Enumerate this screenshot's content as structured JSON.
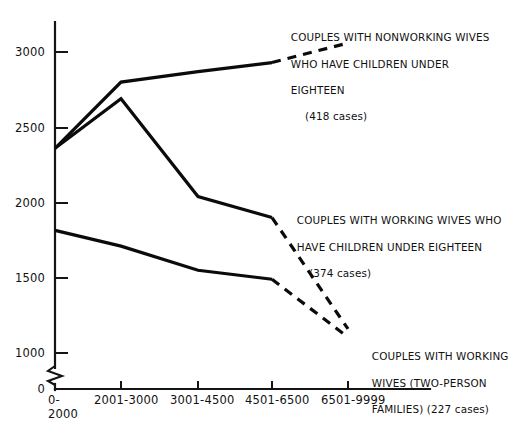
{
  "chart_data": {
    "type": "line",
    "title": "",
    "xlabel": "",
    "ylabel": "",
    "categories": [
      "0-\n2000",
      "2001-3000",
      "3001-4500",
      "4501-6500",
      "6501-9999"
    ],
    "category_labels": [
      {
        "line1": "0-",
        "line2": "2000"
      },
      {
        "line1": "2001-3000",
        "line2": ""
      },
      {
        "line1": "3001-4500",
        "line2": ""
      },
      {
        "line1": "4501-6500",
        "line2": ""
      },
      {
        "line1": "6501-9999",
        "line2": ""
      }
    ],
    "yticks": [
      0,
      1000,
      1500,
      2000,
      2500,
      3000
    ],
    "ytick_labels": [
      "0",
      "1000",
      "1500",
      "2000",
      "2500",
      "3000"
    ],
    "ylim": [
      1000,
      3150
    ],
    "y_axis_break": true,
    "y_axis_break_note": "zigzag break between 0 and 1000",
    "grid": false,
    "legend_position": "inline-annotations",
    "series": [
      {
        "name": "Couples with nonworking wives who have children under eighteen",
        "cases": 418,
        "values": [
          2360,
          2800,
          2870,
          2930,
          3060
        ],
        "solid_through_index": 3,
        "dashed_from_index": 3
      },
      {
        "name": "Couples with working wives who have children under eighteen",
        "cases": 374,
        "values": [
          2360,
          2690,
          2040,
          1900,
          1160
        ],
        "solid_through_index": 3,
        "dashed_from_index": 3
      },
      {
        "name": "Couples with working wives (two-person families)",
        "cases": 227,
        "values": [
          1815,
          1710,
          1550,
          1490,
          1105
        ],
        "solid_through_index": 3,
        "dashed_from_index": 3
      }
    ],
    "annotations": [
      {
        "id": "nonworking",
        "line1": "COUPLES WITH NONWORKING WIVES",
        "line2": "WHO HAVE CHILDREN UNDER",
        "line3": "EIGHTEEN",
        "cases_text": "(418 cases)"
      },
      {
        "id": "working-children",
        "line1": "COUPLES WITH WORKING WIVES WHO",
        "line2": "HAVE CHILDREN UNDER EIGHTEEN",
        "line3": "",
        "cases_text": "(374 cases)"
      },
      {
        "id": "working-twoperson",
        "line1": "COUPLES WITH WORKING",
        "line2": "WIVES (TWO-PERSON",
        "line3": "FAMILIES) (227 cases)",
        "cases_text": ""
      }
    ],
    "colors": {
      "line": "#0b0b0b",
      "axis": "#141414",
      "background": "#ffffff",
      "text": "#111111"
    }
  }
}
